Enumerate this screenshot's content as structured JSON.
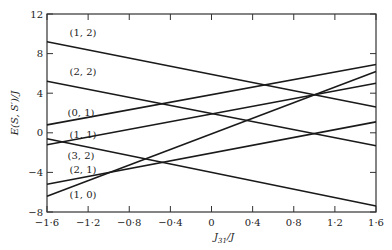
{
  "chart_data": {
    "type": "line",
    "title": "",
    "xlabel": "J_31/J",
    "ylabel": "E(S, S')/J",
    "xlim": [
      -1.6,
      1.6
    ],
    "ylim": [
      -8,
      12
    ],
    "grid": false,
    "legend": "inline labels",
    "x_ticks": [
      -1.6,
      -1.2,
      -0.8,
      -0.4,
      0,
      0.4,
      0.8,
      1.2,
      1.6
    ],
    "x_tick_labels": [
      "−1·6",
      "−1·2",
      "−0·8",
      "−0·4",
      "0",
      "0·4",
      "0·8",
      "1·2",
      "1·6"
    ],
    "y_ticks": [
      -8,
      -4,
      0,
      4,
      8,
      12
    ],
    "y_tick_labels": [
      "−8",
      "−4",
      "0",
      "4",
      "8",
      "12"
    ],
    "x": [
      -1.6,
      1.6
    ],
    "series": [
      {
        "name": "(1, 2)",
        "values": [
          9.2,
          2.6
        ],
        "label_pos": [
          -1.38,
          9.8
        ]
      },
      {
        "name": "(2, 2)",
        "values": [
          5.2,
          -1.3
        ],
        "label_pos": [
          -1.38,
          5.8
        ]
      },
      {
        "name": "(0, 1)",
        "values": [
          0.8,
          6.9
        ],
        "label_pos": [
          -1.4,
          1.7
        ]
      },
      {
        "name": "(1, 1)",
        "values": [
          -1.2,
          5.0
        ],
        "label_pos": [
          -1.38,
          -0.5
        ]
      },
      {
        "name": "(3, 2)",
        "values": [
          -0.6,
          -7.4
        ],
        "label_pos": [
          -1.4,
          -2.6
        ]
      },
      {
        "name": "(2, 1)",
        "values": [
          -5.2,
          1.1
        ],
        "label_pos": [
          -1.38,
          -4.1
        ]
      },
      {
        "name": "(1, 0)",
        "values": [
          -6.4,
          6.2
        ],
        "label_pos": [
          -1.38,
          -6.6
        ]
      }
    ]
  },
  "axes": {
    "xlabel_main": "J",
    "xlabel_sub": "31",
    "xlabel_rest": "/J",
    "ylabel": "E(S, S′)/J"
  }
}
